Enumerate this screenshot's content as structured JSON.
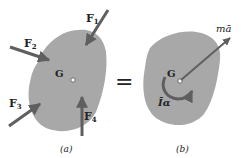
{
  "colors": {
    "body_fill": "#a8a8a8",
    "arrow": "#5f5f5f",
    "text": "#222222",
    "background": "#ffffff"
  },
  "panel_a": {
    "caption": "(a)",
    "center_label": "G",
    "forces": [
      {
        "label": "F",
        "sub": "1"
      },
      {
        "label": "F",
        "sub": "2"
      },
      {
        "label": "F",
        "sub": "3"
      },
      {
        "label": "F",
        "sub": "4"
      }
    ]
  },
  "equals_sign": "=",
  "panel_b": {
    "caption": "(b)",
    "center_label": "G",
    "linear_label": "mā",
    "moment_label": "Īα"
  }
}
